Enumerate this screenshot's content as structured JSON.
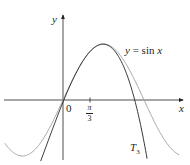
{
  "chart_data": {
    "type": "line",
    "title": "",
    "xlabel": "x",
    "ylabel": "y",
    "origin_label": "0",
    "x_ticks": [
      {
        "value": 1.0472,
        "label_num": "π",
        "label_den": "3"
      }
    ],
    "xlim": [
      -2.26,
      4.65
    ],
    "ylim": [
      -1.07,
      1.52
    ],
    "grid": false,
    "legend": "none (curves labeled inline)",
    "series": [
      {
        "name": "y = sin x",
        "label": "y = sin x",
        "expr": "sin(x)",
        "color": "#a7a9ac",
        "x_range": [
          -2.26,
          4.5
        ],
        "key_points": [
          [
            -1.5708,
            -1
          ],
          [
            0,
            0
          ],
          [
            1.5708,
            1
          ],
          [
            3.1416,
            0
          ]
        ]
      },
      {
        "name": "T3",
        "label_main": "T",
        "label_sub": "3",
        "expr": "sin(π/3) + cos(π/3)(x−π/3) − sin(π/3)/2 (x−π/3)² − cos(π/3)/6 (x−π/3)³",
        "color": "#231f20",
        "x_range": [
          -0.95,
          3.6
        ],
        "key_points": [
          [
            1.0472,
            0.866
          ],
          [
            2.83,
            0.0
          ]
        ]
      }
    ],
    "annotations": [
      {
        "text": "y = sin x",
        "near": "right of peak"
      },
      {
        "text": "T3",
        "near": "bottom right, left of T3 curve tail"
      }
    ]
  },
  "labels": {
    "y_axis": "y",
    "x_axis": "x",
    "origin": "0",
    "tick_num": "π",
    "tick_den": "3",
    "sin_label_y": "y",
    "sin_label_eq": " = sin ",
    "sin_label_x": "x",
    "t3_main": "T",
    "t3_sub": "3"
  }
}
